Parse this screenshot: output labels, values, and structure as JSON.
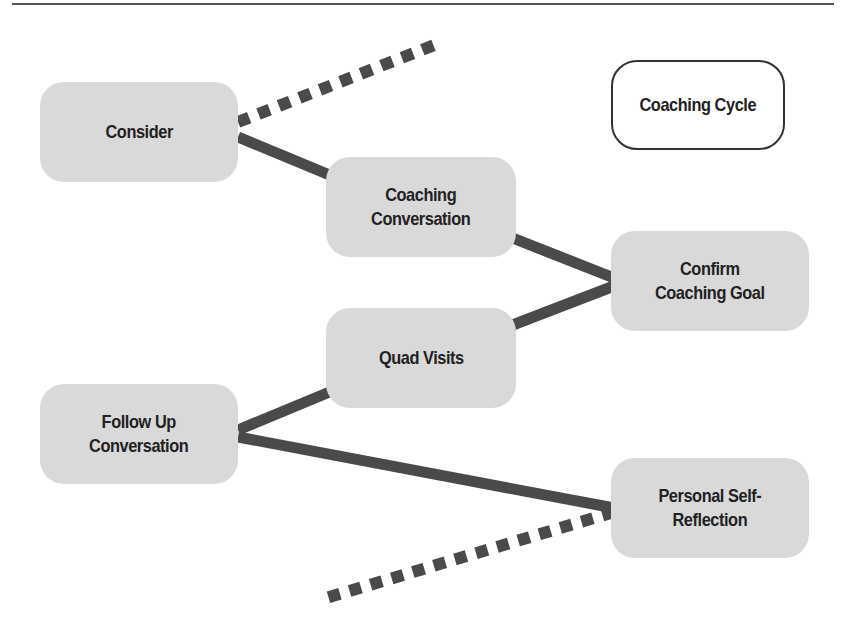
{
  "diagram": {
    "legend": {
      "label": "Coaching Cycle"
    },
    "nodes": [
      {
        "id": "consider",
        "label": "Consider"
      },
      {
        "id": "coaching-conversation",
        "label": "Coaching\nConversation"
      },
      {
        "id": "confirm-coaching-goal",
        "label": "Confirm\nCoaching Goal"
      },
      {
        "id": "quad-visits",
        "label": "Quad Visits"
      },
      {
        "id": "follow-up-conversation",
        "label": "Follow Up\nConversation"
      },
      {
        "id": "personal-self-reflection",
        "label": "Personal Self-\nReflection"
      }
    ],
    "edges": [
      {
        "from": "consider",
        "to": "off-canvas-top",
        "style": "dashed"
      },
      {
        "from": "consider",
        "to": "coaching-conversation",
        "style": "solid"
      },
      {
        "from": "coaching-conversation",
        "to": "confirm-coaching-goal",
        "style": "solid"
      },
      {
        "from": "confirm-coaching-goal",
        "to": "quad-visits",
        "style": "solid"
      },
      {
        "from": "quad-visits",
        "to": "follow-up-conversation",
        "style": "solid"
      },
      {
        "from": "follow-up-conversation",
        "to": "personal-self-reflection",
        "style": "solid"
      },
      {
        "from": "personal-self-reflection",
        "to": "off-canvas-bottom",
        "style": "dashed"
      }
    ],
    "colors": {
      "node_fill": "#d9d9d9",
      "edge": "#4a4a4a",
      "text": "#222222"
    }
  }
}
